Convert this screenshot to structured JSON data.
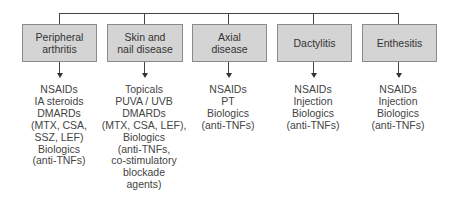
{
  "diagram": {
    "type": "tree",
    "root_connector": "horizontal bar",
    "categories": [
      {
        "label_lines": [
          "Peripheral",
          "arthritis"
        ],
        "treatments": [
          "NSAIDs",
          "IA steroids",
          "DMARDs",
          "(MTX, CSA,",
          "SSZ, LEF)",
          "Biologics",
          "(anti-TNFs)"
        ]
      },
      {
        "label_lines": [
          "Skin and",
          "nail disease"
        ],
        "treatments": [
          "Topicals",
          "PUVA / UVB",
          "DMARDs",
          "(MTX, CSA, LEF),",
          "Biologics",
          "(anti-TNFs,",
          "co-stimulatory",
          "blockade",
          "agents)"
        ]
      },
      {
        "label_lines": [
          "Axial",
          "disease"
        ],
        "treatments": [
          "NSAIDs",
          "PT",
          "Biologics",
          "(anti-TNFs)"
        ]
      },
      {
        "label_lines": [
          "Dactylitis"
        ],
        "treatments": [
          "NSAIDs",
          "Injection",
          "Biologics",
          "(anti-TNFs)"
        ]
      },
      {
        "label_lines": [
          "Enthesitis"
        ],
        "treatments": [
          "NSAIDs",
          "Injection",
          "Biologics",
          "(anti-TNFs)"
        ]
      }
    ],
    "colors": {
      "box_fill": "#d4d4d4",
      "box_border": "#8a8a8a",
      "line": "#444444",
      "text": "#3a3a3a"
    }
  }
}
